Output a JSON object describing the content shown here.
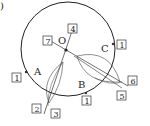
{
  "figure": {
    "corner_mark": ")",
    "center_label": "O",
    "points": [
      {
        "label": "A"
      },
      {
        "label": "B"
      },
      {
        "label": "C"
      }
    ],
    "step_boxes": [
      {
        "id": "A",
        "value": "1"
      },
      {
        "id": "B",
        "value": "1"
      },
      {
        "id": "C",
        "value": "1"
      },
      {
        "id": "s2",
        "value": "2"
      },
      {
        "id": "s3",
        "value": "3"
      },
      {
        "id": "s4",
        "value": "4"
      },
      {
        "id": "s5",
        "value": "5"
      },
      {
        "id": "s6",
        "value": "6"
      },
      {
        "id": "s7",
        "value": "7"
      }
    ],
    "colors": {
      "stroke": "#333333",
      "circle": "#222222"
    }
  }
}
